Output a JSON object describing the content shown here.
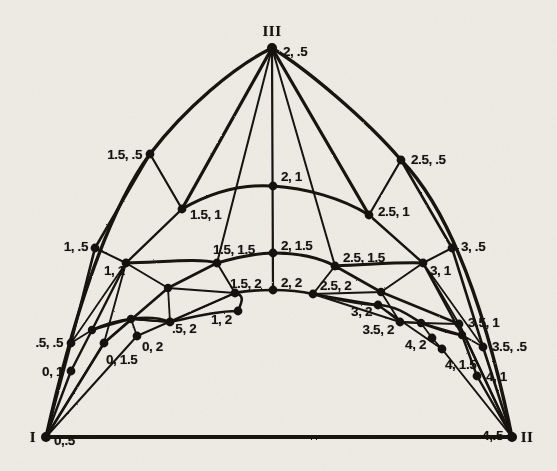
{
  "figure": {
    "width": 557,
    "height": 471,
    "ink_color": "#141210",
    "paper_color": "#efece6"
  },
  "vertices": [
    {
      "name": "vertex-I",
      "label": "I",
      "x": 46,
      "y": 437,
      "lx": 33,
      "ly": 437,
      "align": "c"
    },
    {
      "name": "vertex-II",
      "label": "II",
      "x": 512,
      "y": 437,
      "lx": 527,
      "ly": 437,
      "align": "c"
    },
    {
      "name": "vertex-III",
      "label": "III",
      "x": 272,
      "y": 48,
      "lx": 272,
      "ly": 31,
      "align": "c"
    }
  ],
  "nodes": [
    {
      "id": "n_0_05",
      "label": "0,.5",
      "x": 46,
      "y": 437,
      "lx": 54,
      "ly": 441,
      "align": "r"
    },
    {
      "id": "n_4_05",
      "label": "4,.5",
      "x": 512,
      "y": 437,
      "lx": 503,
      "ly": 436,
      "align": "l"
    },
    {
      "id": "n_2_05",
      "label": "2, .5",
      "x": 272,
      "y": 48,
      "lx": 283,
      "ly": 52,
      "align": "r"
    },
    {
      "id": "n_05_05",
      "label": ".5, .5",
      "x": 71,
      "y": 343,
      "lx": 63,
      "ly": 343,
      "align": "l"
    },
    {
      "id": "n_0_1",
      "label": "0, 1",
      "x": 71,
      "y": 371,
      "lx": 63,
      "ly": 372,
      "align": "l"
    },
    {
      "id": "n_0_15",
      "label": "0, 1.5",
      "x": 104,
      "y": 343,
      "lx": 106,
      "ly": 360,
      "align": "r"
    },
    {
      "id": "n_0_2",
      "label": "0, 2",
      "x": 137,
      "y": 336,
      "lx": 142,
      "ly": 347,
      "align": "r"
    },
    {
      "id": "n_1_05",
      "label": "1, .5",
      "x": 95,
      "y": 248,
      "lx": 88,
      "ly": 247,
      "align": "l"
    },
    {
      "id": "n_1_1",
      "label": "1, 1",
      "x": 126,
      "y": 263,
      "lx": 104,
      "ly": 271,
      "align": "r"
    },
    {
      "id": "n_05_2",
      "label": ".5, 2",
      "x": 170,
      "y": 322,
      "lx": 172,
      "ly": 329,
      "align": "r"
    },
    {
      "id": "n_1_2",
      "label": "1, 2",
      "x": 238,
      "y": 311,
      "lx": 211,
      "ly": 320,
      "align": "r"
    },
    {
      "id": "n_15_05",
      "label": "1.5, .5",
      "x": 150,
      "y": 154,
      "lx": 142,
      "ly": 155,
      "align": "l"
    },
    {
      "id": "n_15_1",
      "label": "1.5, 1",
      "x": 182,
      "y": 209,
      "lx": 190,
      "ly": 215,
      "align": "r"
    },
    {
      "id": "n_15_15",
      "label": "1.5, 1.5",
      "x": 217,
      "y": 263,
      "lx": 213,
      "ly": 250,
      "align": "r"
    },
    {
      "id": "n_15_2",
      "label": "1.5, 2",
      "x": 235,
      "y": 293,
      "lx": 230,
      "ly": 284,
      "align": "r"
    },
    {
      "id": "n_2_1",
      "label": "2, 1",
      "x": 273,
      "y": 186,
      "lx": 281,
      "ly": 177,
      "align": "r"
    },
    {
      "id": "n_2_15",
      "label": "2, 1.5",
      "x": 273,
      "y": 253,
      "lx": 281,
      "ly": 246,
      "align": "r"
    },
    {
      "id": "n_2_2",
      "label": "2, 2",
      "x": 273,
      "y": 290,
      "lx": 281,
      "ly": 283,
      "align": "r"
    },
    {
      "id": "n_25_05",
      "label": "2.5, .5",
      "x": 401,
      "y": 160,
      "lx": 411,
      "ly": 160,
      "align": "r"
    },
    {
      "id": "n_25_1",
      "label": "2.5, 1",
      "x": 369,
      "y": 215,
      "lx": 378,
      "ly": 212,
      "align": "r"
    },
    {
      "id": "n_25_15",
      "label": "2.5, 1.5",
      "x": 335,
      "y": 266,
      "lx": 343,
      "ly": 258,
      "align": "r"
    },
    {
      "id": "n_25_2",
      "label": "2.5, 2",
      "x": 313,
      "y": 294,
      "lx": 320,
      "ly": 286,
      "align": "r"
    },
    {
      "id": "n_3_05",
      "label": "3, .5",
      "x": 452,
      "y": 248,
      "lx": 461,
      "ly": 247,
      "align": "r"
    },
    {
      "id": "n_3_1",
      "label": "3, 1",
      "x": 423,
      "y": 263,
      "lx": 430,
      "ly": 271,
      "align": "r"
    },
    {
      "id": "n_3_2",
      "label": "3, 2",
      "x": 378,
      "y": 305,
      "lx": 372,
      "ly": 312,
      "align": "l"
    },
    {
      "id": "n_35_2",
      "label": "3.5, 2",
      "x": 400,
      "y": 322,
      "lx": 394,
      "ly": 330,
      "align": "l"
    },
    {
      "id": "n_35_1",
      "label": "3.5, 1",
      "x": 459,
      "y": 324,
      "lx": 468,
      "ly": 323,
      "align": "r"
    },
    {
      "id": "n_35_05",
      "label": "3.5, .5",
      "x": 483,
      "y": 347,
      "lx": 492,
      "ly": 347,
      "align": "r"
    },
    {
      "id": "n_4_2",
      "label": "4, 2",
      "x": 432,
      "y": 338,
      "lx": 426,
      "ly": 345,
      "align": "l"
    },
    {
      "id": "n_4_15",
      "label": "4, 1.5",
      "x": 442,
      "y": 349,
      "lx": 445,
      "ly": 365,
      "align": "r"
    },
    {
      "id": "n_4_1",
      "label": "4, 1",
      "x": 477,
      "y": 376,
      "lx": 486,
      "ly": 377,
      "align": "r"
    }
  ],
  "unlabeled_nodes": [
    {
      "id": "u_l1",
      "x": 168,
      "y": 288
    },
    {
      "id": "u_l2",
      "x": 131,
      "y": 319
    },
    {
      "id": "u_l3",
      "x": 92,
      "y": 330
    },
    {
      "id": "u_r1",
      "x": 381,
      "y": 292
    },
    {
      "id": "u_r2",
      "x": 421,
      "y": 323
    },
    {
      "id": "u_r3",
      "x": 462,
      "y": 335
    }
  ],
  "chart_data": {
    "type": "diagram-net",
    "vertex_labels": [
      "I",
      "II",
      "III"
    ],
    "vertex_coordinates": [
      "0,.5",
      "4,.5",
      "2, .5"
    ],
    "point_labels": [
      "0,.5",
      ".5, .5",
      "0, 1",
      "0, 1.5",
      "0, 2",
      "1, .5",
      "1, 1",
      ".5, 2",
      "1, 2",
      "1.5, .5",
      "1.5, 1",
      "1.5, 1.5",
      "1.5, 2",
      "2, .5",
      "2, 1",
      "2, 1.5",
      "2, 2",
      "2.5, .5",
      "2.5, 1",
      "2.5, 1.5",
      "2.5, 2",
      "3, .5",
      "3, 1",
      "3, 2",
      "3.5, 2",
      "3.5, .5",
      "3.5, 1",
      "4, 1",
      "4, 1.5",
      "4, 2",
      "4,.5"
    ],
    "first_coordinate_values": [
      0,
      0.5,
      1,
      1.5,
      2,
      2.5,
      3,
      3.5,
      4
    ],
    "second_coordinate_values": [
      0.5,
      1,
      1.5,
      2
    ],
    "grid": "off",
    "legend": "none"
  }
}
